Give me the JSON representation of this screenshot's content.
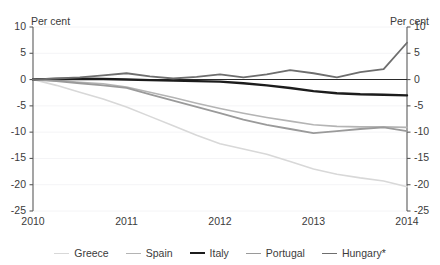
{
  "chart_data": {
    "type": "line",
    "title": "",
    "xlabel": "",
    "ylabel": "Per cent",
    "ylabel_right": "Per cent",
    "x": [
      2010,
      2011,
      2012,
      2013,
      2014
    ],
    "xlim": [
      2010,
      2014
    ],
    "ylim": [
      -25,
      10
    ],
    "yticks": [
      10,
      5,
      0,
      -5,
      -10,
      -15,
      -20,
      -25
    ],
    "ytick_labels": [
      "10",
      "5",
      "0",
      "-5",
      "-10",
      "-15",
      "-20",
      "-25"
    ],
    "xticks": [
      2010,
      2011,
      2012,
      2013,
      2014
    ],
    "xtick_labels": [
      "2010",
      "2011",
      "2012",
      "2013",
      "2014"
    ],
    "grid": "horizontal-faint",
    "legend_position": "bottom",
    "zero_line": true,
    "series": [
      {
        "name": "Greece",
        "color": "#d8d8d8",
        "width": 1.6,
        "x": [
          2010,
          2010.25,
          2010.5,
          2010.75,
          2011,
          2011.25,
          2011.5,
          2011.75,
          2012,
          2012.25,
          2012.5,
          2012.75,
          2013,
          2013.25,
          2013.5,
          2013.75,
          2014
        ],
        "values": [
          0,
          -1.1,
          -2.4,
          -3.7,
          -5.2,
          -7.0,
          -8.8,
          -10.6,
          -12.2,
          -13.2,
          -14.2,
          -15.6,
          -17.0,
          -18.0,
          -18.7,
          -19.3,
          -20.4
        ]
      },
      {
        "name": "Spain",
        "color": "#b4b4b4",
        "width": 1.6,
        "x": [
          2010,
          2010.25,
          2010.5,
          2010.75,
          2011,
          2011.25,
          2011.5,
          2011.75,
          2012,
          2012.25,
          2012.5,
          2012.75,
          2013,
          2013.25,
          2013.5,
          2013.75,
          2014
        ],
        "values": [
          0,
          -0.2,
          -0.5,
          -0.8,
          -1.4,
          -2.4,
          -3.4,
          -4.5,
          -5.5,
          -6.4,
          -7.2,
          -7.9,
          -8.6,
          -8.9,
          -9.0,
          -9.0,
          -9.1
        ]
      },
      {
        "name": "Italy",
        "color": "#1c1c1c",
        "width": 2.4,
        "x": [
          2010,
          2010.25,
          2010.5,
          2010.75,
          2011,
          2011.25,
          2011.5,
          2011.75,
          2012,
          2012.25,
          2012.5,
          2012.75,
          2013,
          2013.25,
          2013.5,
          2013.75,
          2014
        ],
        "values": [
          0,
          0.1,
          0.15,
          0.1,
          0.0,
          -0.1,
          -0.2,
          -0.3,
          -0.4,
          -0.7,
          -1.1,
          -1.6,
          -2.2,
          -2.6,
          -2.8,
          -2.9,
          -3.0
        ]
      },
      {
        "name": "Portugal",
        "color": "#9a9a9a",
        "width": 1.8,
        "x": [
          2010,
          2010.25,
          2010.5,
          2010.75,
          2011,
          2011.25,
          2011.5,
          2011.75,
          2012,
          2012.25,
          2012.5,
          2012.75,
          2013,
          2013.25,
          2013.5,
          2013.75,
          2014
        ],
        "values": [
          0,
          -0.3,
          -0.7,
          -1.1,
          -1.6,
          -2.8,
          -4.0,
          -5.2,
          -6.4,
          -7.6,
          -8.6,
          -9.4,
          -10.2,
          -9.8,
          -9.4,
          -9.1,
          -9.8
        ]
      },
      {
        "name": "Hungary*",
        "color": "#6e6e6e",
        "width": 1.8,
        "x": [
          2010,
          2010.25,
          2010.5,
          2010.75,
          2011,
          2011.25,
          2011.5,
          2011.75,
          2012,
          2012.25,
          2012.5,
          2012.75,
          2013,
          2013.25,
          2013.5,
          2013.75,
          2014
        ],
        "values": [
          0,
          0.2,
          0.4,
          0.8,
          1.2,
          0.6,
          0.2,
          0.5,
          1.0,
          0.4,
          1.0,
          1.8,
          1.2,
          0.4,
          1.4,
          2.0,
          7.0
        ]
      }
    ]
  },
  "axis": {
    "unit_left": "Per cent",
    "unit_right": "Per cent"
  },
  "legend": {
    "items": [
      {
        "label": "Greece"
      },
      {
        "label": "Spain"
      },
      {
        "label": "Italy"
      },
      {
        "label": "Portugal"
      },
      {
        "label": "Hungary*"
      }
    ]
  }
}
